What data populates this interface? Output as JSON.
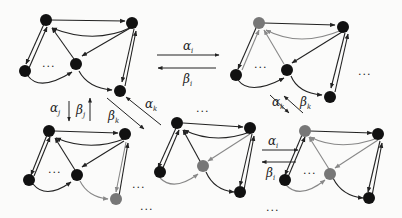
{
  "colors": {
    "background": "#fbfbfa",
    "node_black": "#111111",
    "node_gray": "#777777",
    "edge_black": "#222222",
    "edge_gray": "#888888"
  },
  "graphs": [
    {
      "id": "g1",
      "position": "top-left",
      "gray_nodes": []
    },
    {
      "id": "g2",
      "position": "top-right",
      "gray_nodes": [
        "top-left-node"
      ]
    },
    {
      "id": "g3",
      "position": "bottom-left",
      "gray_nodes": [
        "bottom-right-node"
      ]
    },
    {
      "id": "g4",
      "position": "bottom-middle",
      "gray_nodes": [
        "center-node"
      ]
    },
    {
      "id": "g5",
      "position": "bottom-right",
      "gray_nodes": [
        "top-left-node",
        "center-node"
      ]
    }
  ],
  "transitions": [
    {
      "from": "g1",
      "to": "g2",
      "forward": "α",
      "forward_sub": "i",
      "backward": "β",
      "backward_sub": "i"
    },
    {
      "from": "g1",
      "to": "g3",
      "forward": "α",
      "forward_sub": "j",
      "backward": "β",
      "backward_sub": "j"
    },
    {
      "from": "g1",
      "to": "g4",
      "forward": "α",
      "forward_sub": "k",
      "backward": "β",
      "backward_sub": "k"
    },
    {
      "from": "g2",
      "to": "g5",
      "forward": "α",
      "forward_sub": "k",
      "backward": "β",
      "backward_sub": "k"
    },
    {
      "from": "g4",
      "to": "g5",
      "forward": "α",
      "forward_sub": "i",
      "backward": "β",
      "backward_sub": "i"
    }
  ],
  "ellipsis": "..."
}
